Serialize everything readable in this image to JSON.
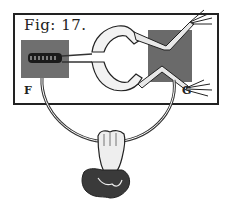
{
  "illustration": {
    "title": "Galvani frog leg experiment engraving",
    "figure_label": "Fig: 17.",
    "plate_left_label": "F",
    "plate_right_label": "G"
  },
  "colors": {
    "ink": "#222222",
    "plate_shade": "#6a6a6a",
    "paper": "#ffffff"
  }
}
